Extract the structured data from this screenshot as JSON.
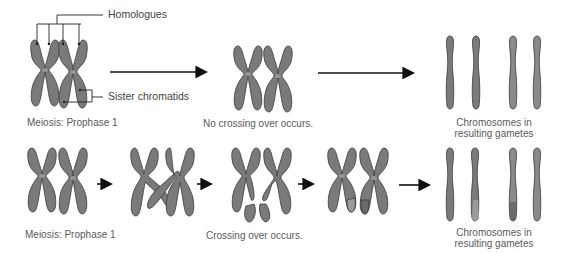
{
  "diagram": {
    "colors": {
      "chromosome_fill": "#7a7a7a",
      "chromosome_light": "#9a9a9a",
      "chromosome_outline": "#3a3a3a",
      "arrow": "#111111",
      "text": "#5a5a5a",
      "background": "#ffffff"
    },
    "top_row": {
      "callouts": {
        "homologues": "Homologues",
        "sister_chromatids": "Sister chromatids"
      },
      "stage1_label": "Meiosis: Prophase 1",
      "stage2_label": "No crossing over occurs.",
      "result_label_line1": "Chromosomes in",
      "result_label_line2": "resulting gametes"
    },
    "bottom_row": {
      "stage1_label": "Meiosis: Prophase 1",
      "stage3_label": "Crossing over occurs.",
      "result_label_line1": "Chromosomes in",
      "result_label_line2": "resulting gametes"
    }
  }
}
